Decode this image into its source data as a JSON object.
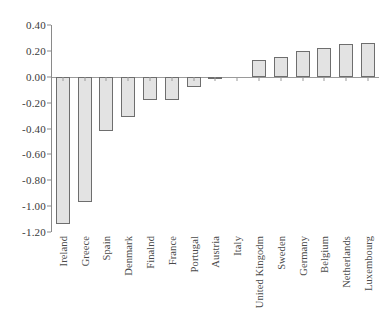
{
  "chart_data": {
    "type": "bar",
    "title": "",
    "subtitle": "",
    "xlabel": "",
    "ylabel": "",
    "grid": false,
    "legend": "none",
    "orientation": "vertical",
    "categories": [
      "Ireland",
      "Greece",
      "Spain",
      "Denmark",
      "Finalnd",
      "France",
      "Portugal",
      "Austria",
      "Italy",
      "United Kingodm",
      "Sweden",
      "Germany",
      "Belgium",
      "Netherlands",
      "Luxembourg"
    ],
    "values": [
      -1.14,
      -0.97,
      -0.42,
      -0.31,
      -0.18,
      -0.18,
      -0.08,
      -0.02,
      0.0,
      0.13,
      0.15,
      0.2,
      0.22,
      0.25,
      0.26
    ],
    "ylim": [
      -1.2,
      0.4
    ],
    "ytick_values": [
      0.4,
      0.2,
      0.0,
      -0.2,
      -0.4,
      -0.6,
      -0.8,
      -1.0,
      -1.2
    ],
    "ytick_labels": [
      "0.40",
      "0.20",
      "0.00",
      "-0.20",
      "-0.40",
      "-0.60",
      "-0.80",
      "-1.00",
      "-1.20"
    ],
    "colors": {
      "bar_fill": "#e3e3e3",
      "bar_border": "#6e6e6e",
      "axis": "#8a8a8a",
      "zero_line": "#9a9a9a",
      "tick_text": "#3a3a3a",
      "category_text": "#4a4a4a",
      "background": "#ffffff"
    }
  }
}
